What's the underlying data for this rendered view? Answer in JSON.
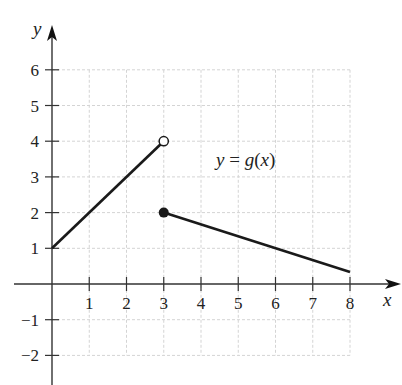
{
  "chart_data": {
    "type": "line",
    "title": "",
    "function_label": "y = g(x)",
    "xlabel": "x",
    "ylabel": "y",
    "xlim": [
      0,
      8
    ],
    "ylim": [
      -2,
      6
    ],
    "grid": true,
    "x_ticks": [
      1,
      2,
      3,
      4,
      5,
      6,
      7,
      8
    ],
    "y_ticks": [
      -2,
      -1,
      1,
      2,
      3,
      4,
      5,
      6
    ],
    "x_tick_labels": [
      "1",
      "2",
      "3",
      "4",
      "5",
      "6",
      "7",
      "8"
    ],
    "y_tick_labels": [
      "−2",
      "−1",
      "1",
      "2",
      "3",
      "4",
      "5",
      "6"
    ],
    "series": [
      {
        "name": "g(x) on [0,3)",
        "points": [
          [
            0,
            1
          ],
          [
            3,
            4
          ]
        ],
        "end_marker": "open"
      },
      {
        "name": "g(x) on [3,8]",
        "points": [
          [
            3,
            2
          ],
          [
            8,
            0.333
          ]
        ],
        "start_marker": "closed"
      }
    ],
    "markers": [
      {
        "x": 3,
        "y": 4,
        "type": "open-circle"
      },
      {
        "x": 3,
        "y": 2,
        "type": "closed-circle"
      }
    ],
    "colors": {
      "line": "#1a1a1a",
      "axis": "#333333",
      "grid": "#d4d4d4"
    }
  }
}
